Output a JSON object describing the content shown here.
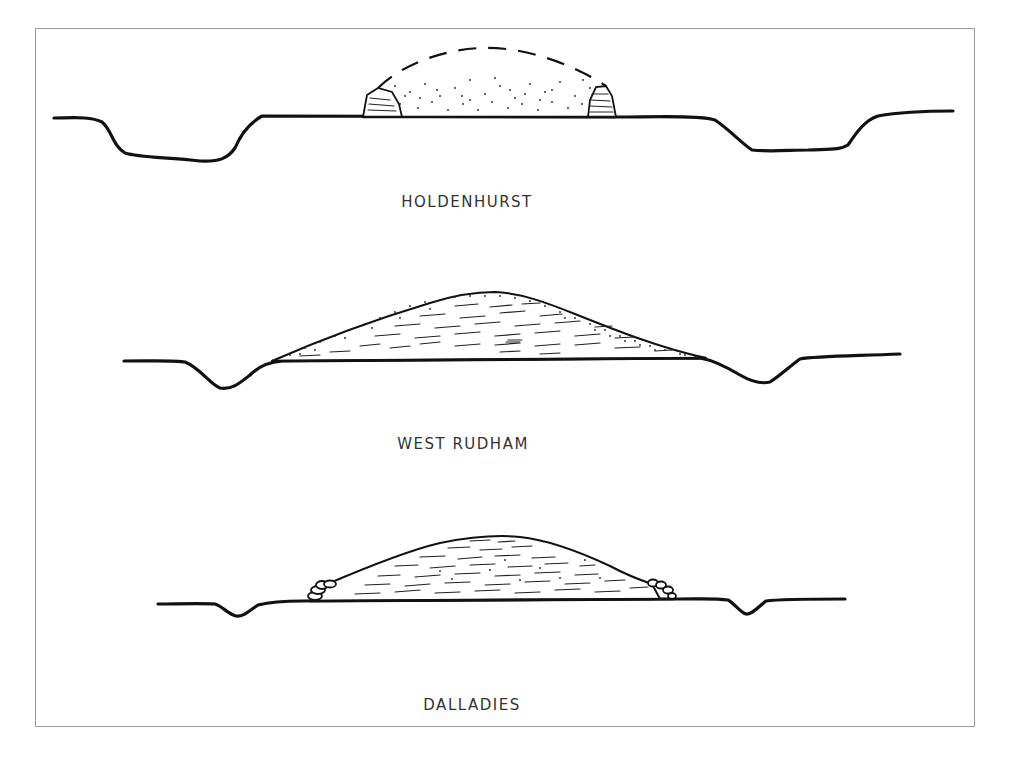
{
  "figure": {
    "type": "archaeological cross-section drawings of long barrows",
    "sections": [
      {
        "id": "holdenhurst",
        "label": "HOLDENHURST",
        "fill_style": "stippled (dots) with dashed reconstructed profile, stone revetments at both ends",
        "flanking_ditches": 2
      },
      {
        "id": "west-rudham",
        "label": "WEST RUDHAM",
        "fill_style": "horizontal dashes (layered) with stippled outer mantle",
        "flanking_ditches": 2
      },
      {
        "id": "dalladies",
        "label": "DALLADIES",
        "fill_style": "horizontal dashes (layered turf) with kerb stones at both ends",
        "flanking_ditches": 2
      }
    ]
  }
}
